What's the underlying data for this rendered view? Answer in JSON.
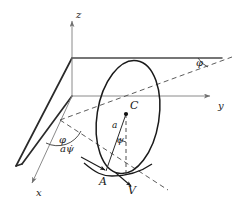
{
  "figure": {
    "kind": "line-diagram",
    "background_color": "#ffffff",
    "ink_color": "#1a1a1a",
    "thin_line_color": "#8a8a8a",
    "width_px": 246,
    "height_px": 209
  },
  "axes": {
    "z_label": "z",
    "y_label": "y",
    "x_label": "x"
  },
  "points": {
    "center_label": "C",
    "contact_label": "A"
  },
  "angles": {
    "phi_plane_label": "φ",
    "phi_ground_label": "φ",
    "psi_label": "ψ"
  },
  "vectors": {
    "radius_label": "a",
    "contact_speed_label": "aψ̇",
    "velocity_label": "V"
  }
}
